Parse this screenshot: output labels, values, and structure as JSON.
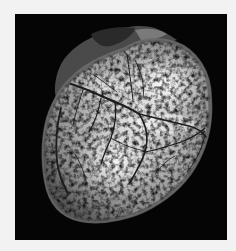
{
  "image": {
    "subject": "heart with coronary vasculature",
    "rendering": "grayscale",
    "background_color": "#f2f2f2",
    "panel_color": "#050505",
    "tissue_colors": {
      "bright": "#f4f4f4",
      "mid": "#9a9a9a",
      "dark": "#3c3c3c",
      "rim": "#6a6a6a",
      "vessel": "#1e1e1e"
    }
  }
}
